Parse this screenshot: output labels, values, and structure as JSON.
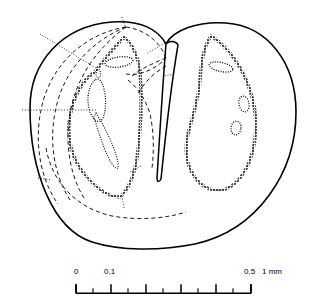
{
  "figure": {
    "type": "anatomical-cross-section-diagram",
    "background_color": "#ffffff",
    "line_color": "#000000"
  },
  "labels": [
    {
      "id": "fd1",
      "base": "fd",
      "sub": "1",
      "x": 24,
      "y": 27,
      "leader": true
    },
    {
      "id": "fd2",
      "base": "fd",
      "sub": "2",
      "x": 113,
      "y": 8,
      "leader": true
    },
    {
      "id": "fd3",
      "base": "fd",
      "sub": "3",
      "x": 171,
      "y": 33,
      "leader": true
    },
    {
      "id": "fd4",
      "base": "fd",
      "sub": "4",
      "x": 175,
      "y": 70,
      "leader": true
    },
    {
      "id": "fb1",
      "base": "fb",
      "sub": "1",
      "x": 4,
      "y": 105,
      "leader": true
    },
    {
      "id": "fb2",
      "base": "fb",
      "sub": "2",
      "x": 118,
      "y": 211,
      "leader": true
    },
    {
      "id": "fb3",
      "base": "fb",
      "sub": "3",
      "x": 142,
      "y": 161,
      "leader": true
    },
    {
      "id": "B1",
      "base": "B",
      "sub": "1",
      "x": 270,
      "y": 106,
      "leader": false
    },
    {
      "id": "B2",
      "base": "B",
      "sub": "2",
      "x": 241,
      "y": 173,
      "leader": false
    },
    {
      "id": "B3",
      "base": "B",
      "sub": "3",
      "x": 191,
      "y": 172,
      "leader": false
    },
    {
      "id": "B4",
      "base": "B",
      "sub": "4",
      "x": 192,
      "y": 120,
      "leader": false
    },
    {
      "id": "B5",
      "base": "B",
      "sub": "5",
      "x": 22,
      "y": 175,
      "leader": false
    },
    {
      "id": "D1",
      "base": "D",
      "sub": "1",
      "x": 236,
      "y": 48,
      "leader": false
    },
    {
      "id": "D2",
      "base": "D",
      "sub": "2",
      "x": 195,
      "y": 59,
      "leader": false
    },
    {
      "id": "D3",
      "base": "D",
      "sub": "3",
      "x": 188,
      "y": 82,
      "leader": false
    }
  ],
  "scale_bar": {
    "unit_label": "mm",
    "ticks": [
      {
        "value": "0",
        "label": "0",
        "x": 76,
        "major": true,
        "show_label": true
      },
      {
        "value": "0.05",
        "label": "",
        "x": 93,
        "major": false,
        "show_label": false
      },
      {
        "value": "0.1",
        "label": "0,1",
        "x": 111,
        "major": true,
        "show_label": true
      },
      {
        "value": "0.15",
        "label": "",
        "x": 128,
        "major": false,
        "show_label": false
      },
      {
        "value": "0.2",
        "label": "",
        "x": 146,
        "major": true,
        "show_label": false
      },
      {
        "value": "0.25",
        "label": "",
        "x": 163,
        "major": false,
        "show_label": false
      },
      {
        "value": "0.3",
        "label": "",
        "x": 181,
        "major": true,
        "show_label": false
      },
      {
        "value": "0.35",
        "label": "",
        "x": 198,
        "major": false,
        "show_label": false
      },
      {
        "value": "0.4",
        "label": "",
        "x": 216,
        "major": true,
        "show_label": false
      },
      {
        "value": "0.45",
        "label": "",
        "x": 233,
        "major": false,
        "show_label": false
      },
      {
        "value": "0.5",
        "label": "0,5",
        "x": 251,
        "major": true,
        "show_label": true
      }
    ],
    "end_label": "1  mm",
    "labels_y": 268,
    "baseline_y": 294,
    "left_x": 76,
    "right_x": 251
  }
}
